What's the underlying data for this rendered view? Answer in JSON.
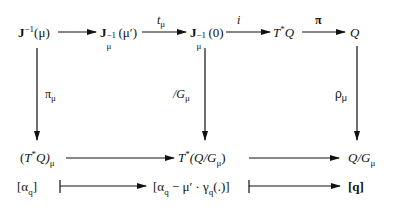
{
  "diagram": {
    "type": "commutative-diagram",
    "row1": {
      "n1": {
        "base": "J",
        "sup": "−1",
        "arg": "(μ)"
      },
      "n2": {
        "base": "J",
        "sub": "μ",
        "sup": "−1",
        "arg": "(μ′)"
      },
      "n3": {
        "base": "J",
        "sub": "μ",
        "sup": "−1",
        "arg": "(0)"
      },
      "n4": {
        "base": "T",
        "sup": "*",
        "rest": "Q"
      },
      "n5": {
        "text": "Q"
      }
    },
    "row1_arrows": {
      "a1": "",
      "a2": {
        "base": "t",
        "sub": "μ"
      },
      "a3": "i",
      "a4": "π"
    },
    "vertical_arrows": {
      "left": {
        "base": "π",
        "sub": "μ"
      },
      "middle": {
        "base": "/G",
        "sub": "μ"
      },
      "right": {
        "base": "ρ",
        "sub": "μ"
      }
    },
    "row2": {
      "n1": {
        "open": "(",
        "base": "T",
        "sup": "*",
        "rest": "Q)",
        "sub": "μ"
      },
      "n2": {
        "base": "T",
        "sup": "*",
        "rest": "(Q/G",
        "sub": "μ",
        "close": ")"
      },
      "n3": {
        "base": "Q/G",
        "sub": "μ"
      }
    },
    "row3": {
      "n1": {
        "open": "[α",
        "sub": "q",
        "close": "]"
      },
      "n2": {
        "open": "[α",
        "sub1": "q",
        "mid": " − μ′ · γ",
        "sub2": "q",
        "close": "(.)]"
      },
      "n3": {
        "text": "[q]"
      }
    }
  }
}
